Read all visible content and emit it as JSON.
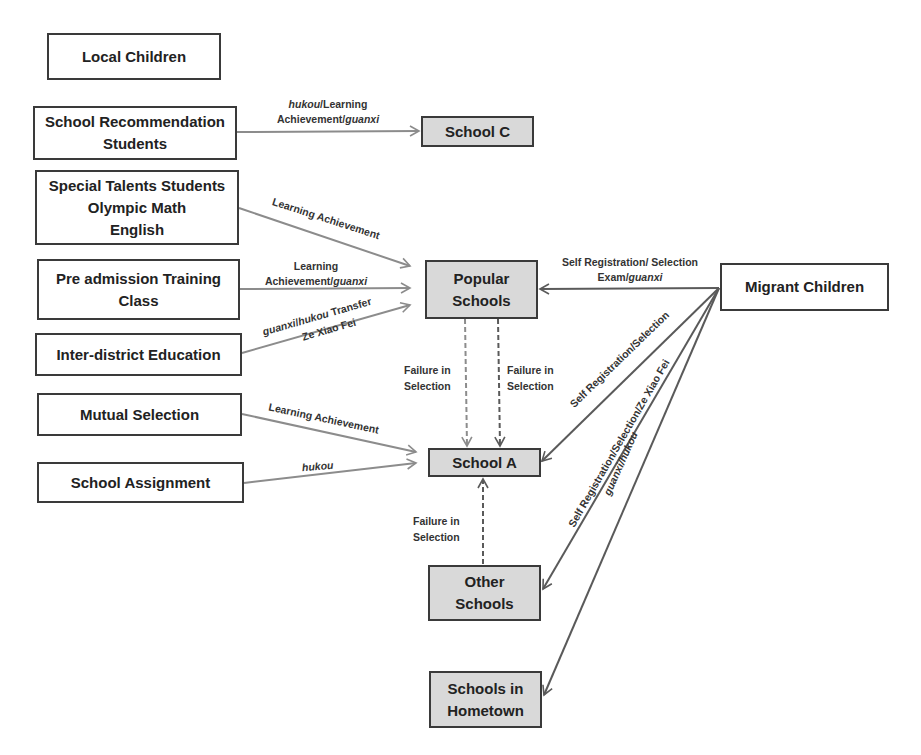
{
  "nodes": {
    "local_children": {
      "label": "Local Children"
    },
    "school_recommendation": {
      "lines": [
        "School Recommendation",
        "Students"
      ]
    },
    "special_talents": {
      "lines": [
        "Special Talents Students",
        "Olympic Math",
        "English"
      ]
    },
    "pre_admission": {
      "lines": [
        "Pre admission Training",
        "Class"
      ]
    },
    "inter_district": {
      "label": "Inter-district Education"
    },
    "mutual_selection": {
      "label": "Mutual Selection"
    },
    "school_assignment": {
      "label": "School Assignment"
    },
    "school_c": {
      "label": "School C"
    },
    "popular_schools": {
      "lines": [
        "Popular",
        "Schools"
      ]
    },
    "migrant_children": {
      "label": "Migrant Children"
    },
    "school_a": {
      "label": "School A"
    },
    "other_schools": {
      "lines": [
        "Other",
        "Schools"
      ]
    },
    "schools_hometown": {
      "lines": [
        "Schools in",
        "Hometown"
      ]
    }
  },
  "edges": {
    "recommendation_to_c": {
      "line1_italic": "hukou",
      "line1_rest": "/Learning",
      "line2_rest": "Achievement/",
      "line2_italic": "guanxi"
    },
    "talents_to_popular": {
      "label": "Learning Achievement"
    },
    "preadmission_to_popular": {
      "line1": "Learning",
      "line2_rest": "Achievement/",
      "line2_italic": "guanxi"
    },
    "interdistrict_to_popular": {
      "line1_italic": "guanxi",
      "line1_mid": "/",
      "line1_italic2": "hukou",
      "line1_rest": " Transfer",
      "line2": "Ze Xiao Fei"
    },
    "mutual_to_a": {
      "label": "Learning Achievement"
    },
    "assignment_to_a": {
      "label": "hukou"
    },
    "migrant_to_popular": {
      "line1": "Self Registration/ Selection",
      "line2_rest": "Exam/",
      "line2_italic": "guanxi"
    },
    "migrant_to_a": {
      "label": "Self Registration/Selection"
    },
    "migrant_to_other": {
      "label": "Self Registration/Selection/Ze Xiao Fei"
    },
    "migrant_to_hometown": {
      "label": "guanxi/hukou"
    },
    "popular_to_a_left": {
      "line1": "Failure in",
      "line2": "Selection"
    },
    "popular_to_a_right": {
      "line1": "Failure in",
      "line2": "Selection"
    },
    "other_to_a": {
      "line1": "Failure in",
      "line2": "Selection"
    }
  },
  "colors": {
    "school_fill": "#d9d9d9",
    "border": "#3a3a3a",
    "arrow": "#8c8c8c",
    "arrow_dark": "#5a5a5a"
  }
}
